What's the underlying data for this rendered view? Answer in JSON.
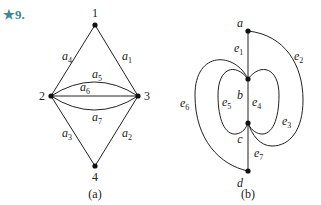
{
  "problem": {
    "label": "★9.",
    "color": "#3a8a9a"
  },
  "graph_a": {
    "caption": "(a)",
    "vertices": [
      {
        "id": "1",
        "label": "1",
        "x": 95,
        "y": 25,
        "lx": 95,
        "ly": 17
      },
      {
        "id": "2",
        "label": "2",
        "x": 51,
        "y": 96,
        "lx": 42,
        "ly": 100
      },
      {
        "id": "3",
        "label": "3",
        "x": 138,
        "y": 96,
        "lx": 147,
        "ly": 100
      },
      {
        "id": "4",
        "label": "4",
        "x": 95,
        "y": 166,
        "lx": 95,
        "ly": 181
      }
    ],
    "edges": [
      {
        "id": "a1",
        "base": "a",
        "sub": "1",
        "from": "3",
        "to": "1",
        "lx": 122,
        "ly": 60
      },
      {
        "id": "a2",
        "base": "a",
        "sub": "2",
        "from": "3",
        "to": "4",
        "lx": 122,
        "ly": 137
      },
      {
        "id": "a3",
        "base": "a",
        "sub": "3",
        "from": "2",
        "to": "4",
        "lx": 62,
        "ly": 137
      },
      {
        "id": "a4",
        "base": "a",
        "sub": "4",
        "from": "2",
        "to": "1",
        "lx": 62,
        "ly": 60
      },
      {
        "id": "a5",
        "base": "a",
        "sub": "5",
        "from": "2",
        "to": "3",
        "lx": 92,
        "ly": 78
      },
      {
        "id": "a6",
        "base": "a",
        "sub": "6",
        "from": "2",
        "to": "3",
        "lx": 80,
        "ly": 91
      },
      {
        "id": "a7",
        "base": "a",
        "sub": "7",
        "from": "2",
        "to": "3",
        "lx": 92,
        "ly": 121
      }
    ]
  },
  "graph_b": {
    "caption": "(b)",
    "vertices": [
      {
        "id": "a",
        "label": "a",
        "x": 248,
        "y": 31,
        "lx": 240,
        "ly": 27
      },
      {
        "id": "b",
        "label": "b",
        "x": 248,
        "y": 79,
        "lx": 240,
        "ly": 99
      },
      {
        "id": "c",
        "label": "c",
        "x": 248,
        "y": 123,
        "lx": 240,
        "ly": 143
      },
      {
        "id": "d",
        "label": "d",
        "x": 248,
        "y": 171,
        "lx": 240,
        "ly": 187
      }
    ],
    "edges": [
      {
        "id": "e1",
        "base": "e",
        "sub": "1",
        "from": "a",
        "to": "b",
        "lx": 234,
        "ly": 52
      },
      {
        "id": "e2",
        "base": "e",
        "sub": "2",
        "from": "a",
        "to": "c",
        "lx": 294,
        "ly": 60
      },
      {
        "id": "e3",
        "base": "e",
        "sub": "3",
        "from": "b",
        "to": "c",
        "lx": 282,
        "ly": 125
      },
      {
        "id": "e4",
        "base": "e",
        "sub": "4",
        "from": "b",
        "to": "c",
        "lx": 252,
        "ly": 106
      },
      {
        "id": "e5",
        "base": "e",
        "sub": "5",
        "from": "b",
        "to": "c",
        "lx": 222,
        "ly": 106
      },
      {
        "id": "e6",
        "base": "e",
        "sub": "6",
        "from": "b",
        "to": "d",
        "lx": 180,
        "ly": 107
      },
      {
        "id": "e7",
        "base": "e",
        "sub": "7",
        "from": "c",
        "to": "d",
        "lx": 254,
        "ly": 157
      }
    ]
  }
}
